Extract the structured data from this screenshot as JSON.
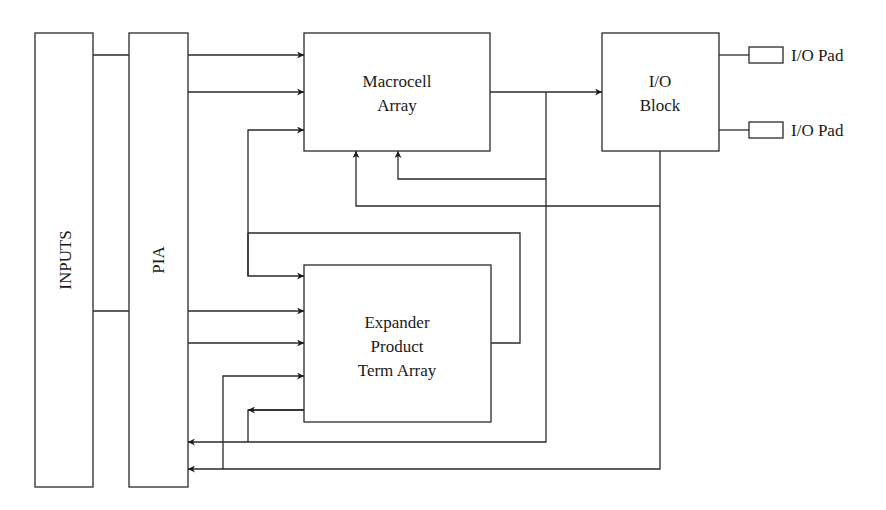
{
  "diagram": {
    "type": "block-diagram",
    "blocks": {
      "inputs": {
        "label": "INPUTS"
      },
      "pia": {
        "label": "PIA"
      },
      "macrocell": {
        "line1": "Macrocell",
        "line2": "Array"
      },
      "io_block": {
        "line1": "I/O",
        "line2": "Block"
      },
      "expander": {
        "line1": "Expander",
        "line2": "Product",
        "line3": "Term Array"
      },
      "io_pad_1": {
        "label": "I/O Pad"
      },
      "io_pad_2": {
        "label": "I/O Pad"
      }
    },
    "colors": {
      "line": "#2a2a2a",
      "background": "#ffffff",
      "text": "#1a1a1a"
    },
    "connections": [
      "INPUTS -> PIA",
      "PIA -> Macrocell Array (x2)",
      "PIA -> Expander Product Term Array (x2)",
      "Expander Product Term Array -> Macrocell Array",
      "Expander Product Term Array -> Expander Product Term Array (feedback)",
      "Macrocell Array -> I/O Block",
      "Macrocell Array -> Macrocell Array (feedback)",
      "Macrocell Array -> PIA",
      "I/O Block -> Macrocell Array",
      "I/O Block -> PIA",
      "I/O Block -> Expander Product Term Array",
      "I/O Block -> I/O Pad (x2)"
    ]
  }
}
